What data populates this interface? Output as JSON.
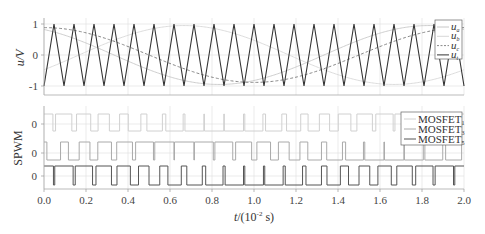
{
  "chart_data": [
    {
      "type": "line",
      "title": "",
      "xlabel": "t/(10^-2 s)",
      "ylabel": "u/V",
      "xlim": [
        0.0,
        2.0
      ],
      "ylim": [
        -1.2,
        1.05
      ],
      "yticks": [
        "-1",
        "0",
        "1"
      ],
      "grid": true,
      "legend_position": "upper right",
      "series": [
        {
          "name": "u_a",
          "style": "solid light gray",
          "kind": "sine",
          "amplitude": 0.95,
          "period": 2.0,
          "phase_deg": 90
        },
        {
          "name": "u_b",
          "style": "solid light gray",
          "kind": "sine",
          "amplitude": 0.95,
          "period": 2.0,
          "phase_deg": -30
        },
        {
          "name": "u_c",
          "style": "dashed gray",
          "kind": "sine",
          "amplitude": 0.95,
          "period": 2.0,
          "phase_deg": 210
        },
        {
          "name": "u_t",
          "style": "solid dark",
          "kind": "triangle carrier",
          "amplitude": 1.0,
          "cycles": 21
        }
      ]
    },
    {
      "type": "line",
      "title": "",
      "xlabel": "t/(10^-2 s)",
      "ylabel": "SPWM",
      "xlim": [
        0.0,
        2.0
      ],
      "xticks": [
        "0.0",
        "0.2",
        "0.4",
        "0.6",
        "0.8",
        "1.0",
        "1.2",
        "1.4",
        "1.6",
        "1.8",
        "2.0"
      ],
      "yticks_per_trace": [
        "0",
        "0",
        "0"
      ],
      "grid": true,
      "legend_position": "upper right",
      "series": [
        {
          "name": "MOSFET_1",
          "style": "solid very light gray",
          "kind": "SPWM pulses from u_a vs u_t"
        },
        {
          "name": "MOSFET_3",
          "style": "solid light gray",
          "kind": "SPWM pulses from u_b vs u_t"
        },
        {
          "name": "MOSFET_5",
          "style": "solid dark gray",
          "kind": "SPWM pulses from u_c vs u_t"
        }
      ]
    }
  ],
  "axes": {
    "top": {
      "ylabel": "u/V",
      "yticks": [
        {
          "v": 1,
          "label": "1"
        },
        {
          "v": 0,
          "label": "0"
        },
        {
          "v": -1,
          "label": "-1"
        }
      ]
    },
    "bottom": {
      "ylabel": "SPWM",
      "yticks": [
        "0",
        "0",
        "0"
      ],
      "xticks": [
        "0.0",
        "0.2",
        "0.4",
        "0.6",
        "0.8",
        "1.0",
        "1.2",
        "1.4",
        "1.6",
        "1.8",
        "2.0"
      ],
      "xlabel_main": "t",
      "xlabel_unit": "/(10",
      "xlabel_exp": "-2",
      "xlabel_tail": " s)"
    }
  },
  "legend_top": [
    {
      "base": "u",
      "sub": "a",
      "style": "solid",
      "color": "#c8c8c8"
    },
    {
      "base": "u",
      "sub": "b",
      "style": "solid",
      "color": "#d8d8d8"
    },
    {
      "base": "u",
      "sub": "c",
      "style": "dashed",
      "color": "#888888"
    },
    {
      "base": "u",
      "sub": "t",
      "style": "solid",
      "color": "#333333"
    }
  ],
  "legend_bottom": [
    {
      "base": "MOSFET",
      "sub": "1",
      "color": "#d0d0d0"
    },
    {
      "base": "MOSFET",
      "sub": "3",
      "color": "#aaaaaa"
    },
    {
      "base": "MOSFET",
      "sub": "5",
      "color": "#555555"
    }
  ],
  "colors": {
    "carrier": "#333333",
    "ua": "#c8c8c8",
    "ub": "#d8d8d8",
    "uc": "#888888",
    "grid": "#e2e2e2",
    "axis": "#999999"
  },
  "params": {
    "carrier_cycles": 21,
    "mod_amplitude": 0.95
  }
}
